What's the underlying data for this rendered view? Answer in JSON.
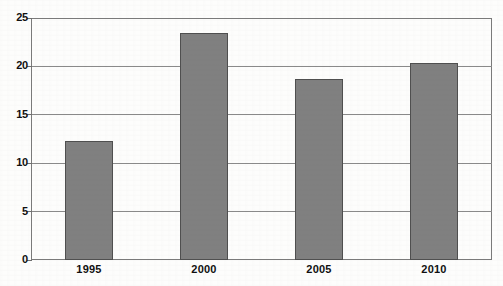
{
  "chart_data": {
    "type": "bar",
    "title": "",
    "subtitle": "",
    "xlabel": "",
    "ylabel": "",
    "categories": [
      "1995",
      "2000",
      "2005",
      "2010"
    ],
    "values": [
      12.3,
      23.5,
      18.7,
      20.4
    ],
    "series": [
      {
        "name": "",
        "values": [
          12.3,
          23.5,
          18.7,
          20.4
        ]
      }
    ],
    "ylim": [
      0,
      25
    ],
    "yticks": [
      0,
      5,
      10,
      15,
      20,
      25
    ],
    "ytick_labels": [
      "0",
      "5",
      "10",
      "15",
      "20",
      "25"
    ],
    "grid": true,
    "legend": false,
    "legend_position": "none",
    "annotations": [],
    "bar_color": "#808080",
    "bar_edge_color": "#4f4f4f",
    "grid_color": "#8a8a8a",
    "axis_color": "#7a7a7a",
    "text_color": "#101010",
    "background_color": "#ffffff"
  }
}
